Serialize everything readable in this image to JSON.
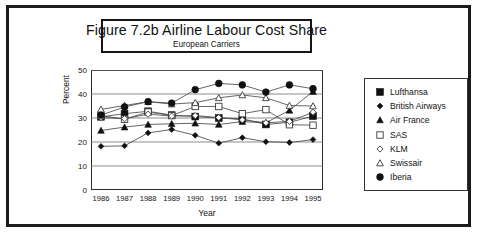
{
  "figure": {
    "title": "Figure 7.2b  Airline Labour Cost Share",
    "subtitle": "European Carriers"
  },
  "axes": {
    "ylabel": "Percent",
    "xlabel": "Year",
    "yticks": [
      "0",
      "10",
      "20",
      "30",
      "40",
      "50"
    ],
    "xticks": [
      "1986",
      "1987",
      "1988",
      "1989",
      "1990",
      "1991",
      "1992",
      "1993",
      "1994",
      "1995"
    ]
  },
  "legend": {
    "items": [
      {
        "label": "Lufthansa",
        "marker": "filled-square-icon"
      },
      {
        "label": "British Airways",
        "marker": "filled-diamond-icon"
      },
      {
        "label": "Air France",
        "marker": "filled-triangle-icon"
      },
      {
        "label": "SAS",
        "marker": "open-square-icon"
      },
      {
        "label": "KLM",
        "marker": "open-diamond-icon"
      },
      {
        "label": "Swissair",
        "marker": "open-triangle-icon"
      },
      {
        "label": "Iberia",
        "marker": "filled-circle-icon"
      }
    ]
  },
  "chart_data": {
    "type": "line",
    "title": "Figure 7.2b  Airline Labour Cost Share",
    "subtitle": "European Carriers",
    "xlabel": "Year",
    "ylabel": "Percent",
    "ylim": [
      0,
      50
    ],
    "ytick_step": 10,
    "grid": true,
    "legend_position": "right",
    "categories": [
      "1986",
      "1987",
      "1988",
      "1989",
      "1990",
      "1991",
      "1992",
      "1993",
      "1994",
      "1995"
    ],
    "series": [
      {
        "name": "Lufthansa",
        "marker": "filled-square",
        "values": [
          30.5,
          31.8,
          32.8,
          31.2,
          30.6,
          30.0,
          29.7,
          27.3,
          28.2,
          30.8
        ]
      },
      {
        "name": "British Airways",
        "marker": "filled-diamond",
        "values": [
          18.2,
          18.4,
          23.8,
          25.2,
          22.8,
          19.5,
          21.8,
          20.1,
          19.8,
          21.0
        ]
      },
      {
        "name": "Air France",
        "marker": "filled-triangle",
        "values": [
          24.8,
          26.2,
          27.3,
          27.6,
          27.8,
          27.3,
          28.5,
          28.0,
          33.2,
          41.0
        ]
      },
      {
        "name": "SAS",
        "marker": "open-square",
        "values": [
          31.0,
          29.5,
          32.5,
          31.0,
          34.8,
          34.8,
          31.8,
          33.5,
          27.2,
          27.0
        ]
      },
      {
        "name": "KLM",
        "marker": "open-diamond",
        "values": [
          30.2,
          29.7,
          31.6,
          30.8,
          31.0,
          30.2,
          29.2,
          28.0,
          28.6,
          32.4
        ]
      },
      {
        "name": "Swissair",
        "marker": "open-triangle",
        "values": [
          33.6,
          35.2,
          36.8,
          35.8,
          36.4,
          38.4,
          39.6,
          38.4,
          35.2,
          35.0
        ]
      },
      {
        "name": "Iberia",
        "marker": "filled-circle",
        "values": [
          31.2,
          34.6,
          36.8,
          36.2,
          41.8,
          44.4,
          43.8,
          40.8,
          43.8,
          42.2
        ]
      }
    ]
  }
}
